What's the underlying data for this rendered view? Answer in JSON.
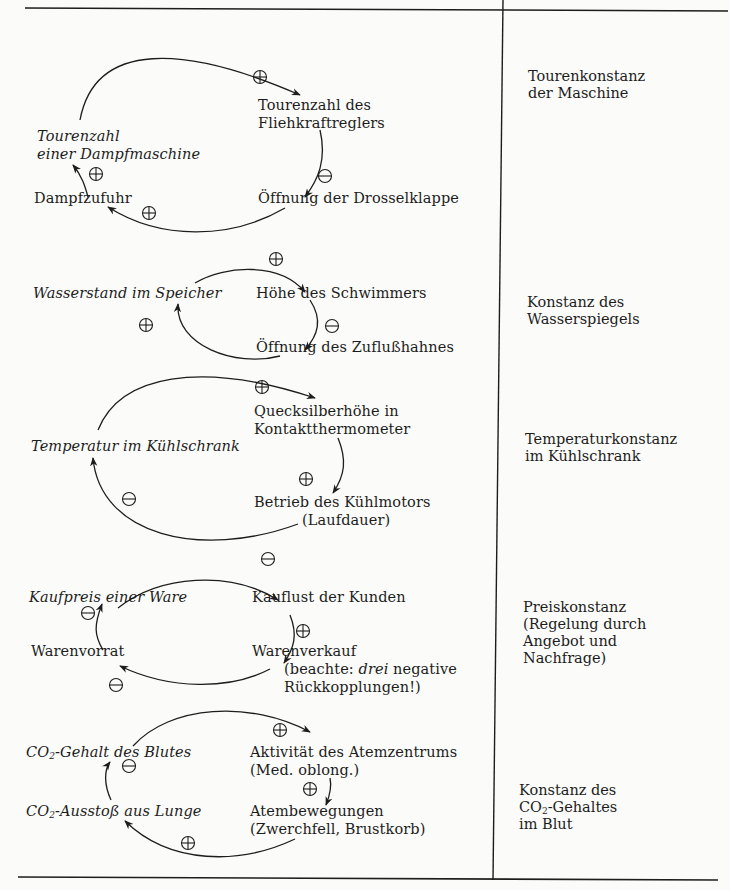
{
  "table": {
    "rows": [
      {
        "id": "dampfmaschine",
        "nodes": {
          "a": "Tourenzahl",
          "a2": "einer Dampfmaschine",
          "b1": "Tourenzahl des",
          "b2": "Fliehkraftreglers",
          "c": "Öffnung der Drosselklappe",
          "d": "Dampfzufuhr"
        },
        "signs": {
          "top": "+",
          "right": "−",
          "bottom": "+",
          "left": "+"
        },
        "result": "Tourenkonstanz\nder Maschine"
      },
      {
        "id": "wasserstand",
        "nodes": {
          "a": "Wasserstand im Speicher",
          "b": "Höhe des Schwimmers",
          "c": "Öffnung des Zuflußhahnes"
        },
        "signs": {
          "top": "+",
          "right": "−",
          "left": "+"
        },
        "result": "Konstanz des\nWasserspiegels"
      },
      {
        "id": "kuehlschrank",
        "nodes": {
          "a": "Temperatur im Kühlschrank",
          "b1": "Quecksilberhöhe in",
          "b2": "Kontaktthermometer",
          "c1": "Betrieb des Kühlmotors",
          "c2": "(Laufdauer)"
        },
        "signs": {
          "top": "+",
          "right": "+",
          "left": "−"
        },
        "result": "Temperaturkonstanz\nim Kühlschrank"
      },
      {
        "id": "preis",
        "nodes": {
          "a": "Kaufpreis einer Ware",
          "b": "Kauflust der Kunden",
          "c": "Warenverkauf",
          "c_note_1": "(beachte: ",
          "c_note_em": "drei",
          "c_note_2": " negative",
          "c_note_3": "Rückkopplungen!)",
          "d": "Warenvorrat"
        },
        "signs": {
          "top": "−",
          "right": "+",
          "bottom": "−",
          "left": "−"
        },
        "result": "Preiskonstanz\n(Regelung durch\nAngebot und\nNachfrage)"
      },
      {
        "id": "co2",
        "nodes": {
          "a_pre": "CO",
          "a_sub": "2",
          "a_post": "-Gehalt des Blutes",
          "b1": "Aktivität des Atemzentrums",
          "b2": "(Med. oblong.)",
          "c1": "Atembewegungen",
          "c2": "(Zwerchfell, Brustkorb)",
          "d_pre": "CO",
          "d_sub": "2",
          "d_post": "-Ausstoß aus Lunge"
        },
        "signs": {
          "top": "+",
          "right": "+",
          "bottom": "+",
          "left": "−"
        },
        "result_1": "Konstanz des",
        "result_2_pre": "CO",
        "result_2_sub": "2",
        "result_2_post": "-Gehaltes",
        "result_3": "im Blut"
      }
    ]
  },
  "colors": {
    "ink": "#1d1d1d",
    "paper": "#fbfbf9"
  }
}
